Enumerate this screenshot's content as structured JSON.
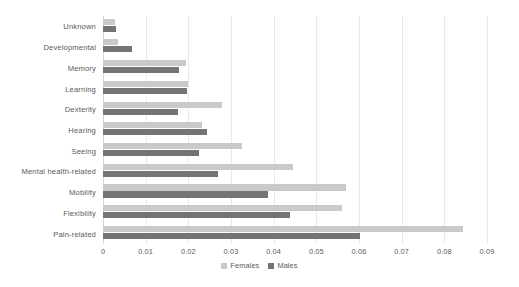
{
  "chart_data": {
    "type": "bar",
    "orientation": "horizontal",
    "title": "",
    "subtitle": "",
    "xlabel": "",
    "ylabel": "",
    "xlim": [
      0,
      0.09
    ],
    "xticks": [
      "0",
      "0.01",
      "0.02",
      "0.03",
      "0.04",
      "0.05",
      "0.06",
      "0.07",
      "0.08",
      "0.09"
    ],
    "xtick_values": [
      0,
      0.01,
      0.02,
      0.03,
      0.04,
      0.05,
      0.06,
      0.07,
      0.08,
      0.09
    ],
    "grid": "vertical",
    "legend_position": "bottom-center",
    "legend": [
      "Females",
      "Males"
    ],
    "categories": [
      "Unknown",
      "Developmental",
      "Memory",
      "Learning",
      "Dexterity",
      "Hearing",
      "Seeing",
      "Mental health-related",
      "Mobility",
      "Flexibility",
      "Pain-related"
    ],
    "series": [
      {
        "name": "Females",
        "color": "#c9c9c9",
        "values": [
          0.0028,
          0.0035,
          0.0195,
          0.0199,
          0.0279,
          0.0232,
          0.0326,
          0.0445,
          0.0569,
          0.056,
          0.0844
        ]
      },
      {
        "name": "Males",
        "color": "#747476",
        "values": [
          0.003,
          0.0068,
          0.0178,
          0.0198,
          0.0176,
          0.0244,
          0.0225,
          0.027,
          0.0387,
          0.0438,
          0.0602
        ]
      }
    ]
  },
  "colors": {
    "background": "#ffffff",
    "females": "#c9c9c9",
    "males": "#747476",
    "gridline": "#e9e9e9",
    "axis_text": "#5a5b5d"
  }
}
